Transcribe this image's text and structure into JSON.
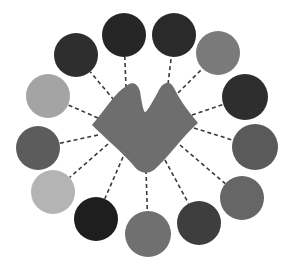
{
  "diagram": {
    "type": "hub-and-spoke",
    "background": "#ffffff",
    "hub": {
      "shape": "double-peak-blob",
      "fill": "#6e6e6e",
      "points": {
        "left_peak": [
          129,
          85
        ],
        "valley": [
          145,
          112
        ],
        "right_peak": [
          168,
          82
        ],
        "right_corner": [
          198,
          123
        ],
        "bottom": [
          146,
          172
        ],
        "left_corner": [
          92,
          125
        ]
      }
    },
    "connector_style": {
      "stroke": "#3a3a3a",
      "dash": "4 3",
      "width": 1.6
    },
    "nodes": [
      {
        "cx": 76,
        "cy": 55,
        "r": 22,
        "fill": "#2e2e2e",
        "anchor": [
          114,
          100
        ]
      },
      {
        "cx": 124,
        "cy": 35,
        "r": 22,
        "fill": "#262626",
        "anchor": [
          126,
          88
        ]
      },
      {
        "cx": 174,
        "cy": 35,
        "r": 22,
        "fill": "#2a2a2a",
        "anchor": [
          168,
          84
        ]
      },
      {
        "cx": 218,
        "cy": 53,
        "r": 22,
        "fill": "#7a7a7a",
        "anchor": [
          178,
          93
        ]
      },
      {
        "cx": 245,
        "cy": 97,
        "r": 23,
        "fill": "#2e2e2e",
        "anchor": [
          192,
          115
        ]
      },
      {
        "cx": 255,
        "cy": 147,
        "r": 23,
        "fill": "#5a5a5a",
        "anchor": [
          194,
          128
        ]
      },
      {
        "cx": 242,
        "cy": 198,
        "r": 22,
        "fill": "#666666",
        "anchor": [
          180,
          145
        ]
      },
      {
        "cx": 199,
        "cy": 223,
        "r": 22,
        "fill": "#3e3e3e",
        "anchor": [
          165,
          160
        ]
      },
      {
        "cx": 148,
        "cy": 234,
        "r": 23,
        "fill": "#707070",
        "anchor": [
          146,
          170
        ]
      },
      {
        "cx": 96,
        "cy": 219,
        "r": 22,
        "fill": "#1e1e1e",
        "anchor": [
          123,
          157
        ]
      },
      {
        "cx": 53,
        "cy": 192,
        "r": 22,
        "fill": "#b4b4b4",
        "anchor": [
          108,
          144
        ]
      },
      {
        "cx": 38,
        "cy": 148,
        "r": 22,
        "fill": "#5c5c5c",
        "anchor": [
          98,
          135
        ]
      },
      {
        "cx": 48,
        "cy": 96,
        "r": 22,
        "fill": "#a4a4a4",
        "anchor": [
          98,
          118
        ]
      }
    ]
  }
}
